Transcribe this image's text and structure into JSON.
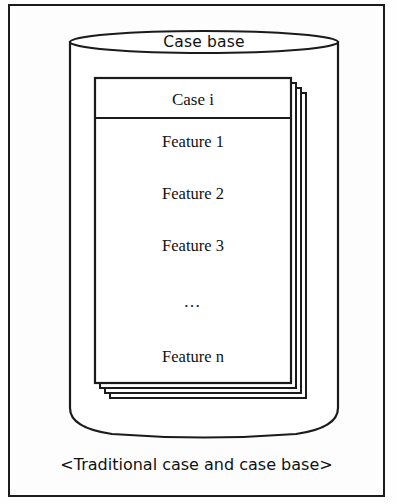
{
  "figure": {
    "caption": "<Traditional case and case base>",
    "container": {
      "label": "Case base",
      "shape": "cylinder"
    },
    "card_stack": {
      "depth": 4,
      "front_card": {
        "title": "Case i",
        "features": [
          "Feature 1",
          "Feature 2",
          "Feature 3",
          "…",
          "Feature n"
        ]
      }
    },
    "colors": {
      "stroke": "#1b1b1b",
      "fill": "#ffffff",
      "background": "#fdfdfd",
      "text": "#121212"
    }
  }
}
